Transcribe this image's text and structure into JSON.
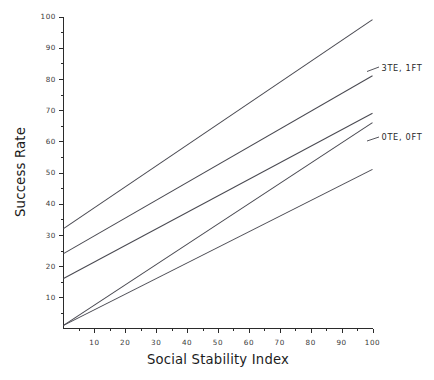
{
  "chart_data": {
    "type": "line",
    "title": "",
    "xlabel": "Social Stability Index",
    "ylabel": "Success Rate",
    "xlim": [
      0,
      100
    ],
    "ylim": [
      0,
      100
    ],
    "xticks": [
      10,
      20,
      30,
      40,
      50,
      60,
      70,
      80,
      90,
      100
    ],
    "yticks": [
      10,
      20,
      30,
      40,
      50,
      60,
      70,
      80,
      90,
      100
    ],
    "grid": false,
    "legend_position": "inline-right-annotations",
    "x": [
      0,
      100
    ],
    "series": [
      {
        "name": "line-1",
        "label": "",
        "values": [
          32,
          99
        ]
      },
      {
        "name": "line-2",
        "label": "3TE, 1FT",
        "values": [
          24,
          81
        ]
      },
      {
        "name": "line-3",
        "label": "",
        "values": [
          16,
          69
        ]
      },
      {
        "name": "line-4",
        "label": "",
        "values": [
          1,
          66
        ]
      },
      {
        "name": "line-5",
        "label": "0TE, 0FT",
        "values": [
          1,
          51
        ]
      }
    ],
    "annotations": [
      {
        "text": "3TE, 1FT",
        "x": 100,
        "y": 81
      },
      {
        "text": "0TE, 0FT",
        "x": 100,
        "y": 56
      }
    ]
  },
  "axes": {
    "y_title": "Success Rate",
    "x_title": "Social Stability Index",
    "y_tick_labels": [
      "10",
      "20",
      "30",
      "40",
      "50",
      "60",
      "70",
      "80",
      "90",
      "100"
    ],
    "x_tick_labels": [
      "10",
      "20",
      "30",
      "40",
      "50",
      "60",
      "70",
      "80",
      "90",
      "100"
    ]
  },
  "labels": {
    "upper": "3TE, 1FT",
    "lower": "0TE, 0FT"
  },
  "colors": {
    "background": "#ffffff",
    "axis": "#2b2b2b",
    "series": "#4a4a52",
    "text": "#1c1c1c"
  }
}
